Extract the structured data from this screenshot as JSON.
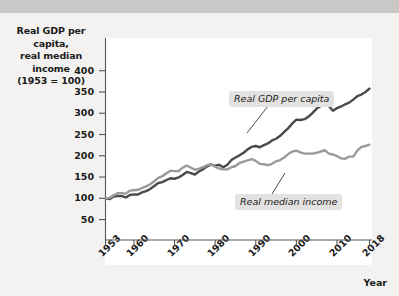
{
  "chart_data": {
    "type": "line",
    "title": "",
    "ylabel": "Real GDP per capita, real median income (1953 = 100)",
    "ylabel_lines": [
      "Real GDP per capita,",
      "real median income",
      "(1953 = 100)"
    ],
    "xlabel": "Year",
    "ylim": [
      0,
      400
    ],
    "yticks": [
      50,
      100,
      150,
      200,
      250,
      300,
      350,
      400
    ],
    "ytick_labels": [
      "50",
      "100",
      "150",
      "200",
      "250",
      "300",
      "350",
      "400"
    ],
    "xlim": [
      1953,
      2018
    ],
    "xticks": [
      1953,
      1960,
      1970,
      1980,
      1990,
      2000,
      2010,
      2018
    ],
    "xtick_labels": [
      "1953",
      "1960",
      "1970",
      "1980",
      "1990",
      "2000",
      "2010",
      "2018"
    ],
    "grid": false,
    "legend_position": "inline-annotations",
    "series": [
      {
        "name": "Real GDP per capita",
        "color": "#4a4a4a",
        "x": [
          1953,
          1954,
          1955,
          1956,
          1957,
          1958,
          1959,
          1960,
          1961,
          1962,
          1963,
          1964,
          1965,
          1966,
          1967,
          1968,
          1969,
          1970,
          1971,
          1972,
          1973,
          1974,
          1975,
          1976,
          1977,
          1978,
          1979,
          1980,
          1981,
          1982,
          1983,
          1984,
          1985,
          1986,
          1987,
          1988,
          1989,
          1990,
          1991,
          1992,
          1993,
          1994,
          1995,
          1996,
          1997,
          1998,
          1999,
          2000,
          2001,
          2002,
          2003,
          2004,
          2005,
          2006,
          2007,
          2008,
          2009,
          2010,
          2011,
          2012,
          2013,
          2014,
          2015,
          2016,
          2017,
          2018
        ],
        "values": [
          100,
          98,
          104,
          105,
          105,
          102,
          108,
          109,
          109,
          114,
          117,
          122,
          129,
          136,
          138,
          143,
          147,
          146,
          149,
          155,
          162,
          159,
          156,
          163,
          168,
          175,
          179,
          176,
          179,
          173,
          179,
          190,
          196,
          201,
          207,
          215,
          221,
          223,
          220,
          225,
          229,
          236,
          240,
          247,
          256,
          265,
          276,
          285,
          284,
          286,
          292,
          301,
          311,
          317,
          322,
          317,
          306,
          312,
          316,
          321,
          325,
          332,
          340,
          344,
          350,
          358
        ],
        "end_label": "Real GDP per capita"
      },
      {
        "name": "Real median income",
        "color": "#9a9a9a",
        "x": [
          1953,
          1954,
          1955,
          1956,
          1957,
          1958,
          1959,
          1960,
          1961,
          1962,
          1963,
          1964,
          1965,
          1966,
          1967,
          1968,
          1969,
          1970,
          1971,
          1972,
          1973,
          1974,
          1975,
          1976,
          1977,
          1978,
          1979,
          1980,
          1981,
          1982,
          1983,
          1984,
          1985,
          1986,
          1987,
          1988,
          1989,
          1990,
          1991,
          1992,
          1993,
          1994,
          1995,
          1996,
          1997,
          1998,
          1999,
          2000,
          2001,
          2002,
          2003,
          2004,
          2005,
          2006,
          2007,
          2008,
          2009,
          2010,
          2011,
          2012,
          2013,
          2014,
          2015,
          2016,
          2017,
          2018
        ],
        "values": [
          100,
          101,
          107,
          112,
          112,
          111,
          118,
          119,
          120,
          124,
          128,
          133,
          140,
          148,
          152,
          159,
          165,
          164,
          164,
          172,
          177,
          172,
          167,
          170,
          173,
          178,
          180,
          174,
          170,
          168,
          168,
          173,
          176,
          183,
          186,
          189,
          192,
          188,
          181,
          180,
          178,
          181,
          187,
          190,
          196,
          204,
          210,
          212,
          208,
          205,
          205,
          205,
          207,
          210,
          213,
          205,
          203,
          199,
          194,
          193,
          198,
          198,
          212,
          221,
          223,
          226
        ],
        "end_label": "Real median income"
      }
    ],
    "annotations": [
      {
        "text": "Real GDP per capita",
        "series": "Real GDP per capita"
      },
      {
        "text": "Real median income",
        "series": "Real median income"
      }
    ]
  },
  "axis_titles": {
    "y_line1": "Real GDP per capita,",
    "y_line2": "real median income",
    "y_line3": "(1953 = 100)",
    "x": "Year"
  }
}
